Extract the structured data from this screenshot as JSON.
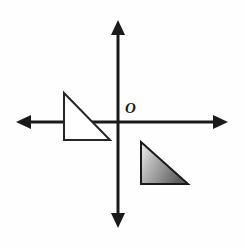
{
  "figure": {
    "background_color": "#fefefe",
    "width": 245,
    "height": 248
  },
  "axes": {
    "stroke_color": "#1a1a1a",
    "stroke_width": 3,
    "origin": {
      "x": 118,
      "y": 122
    },
    "x_axis": {
      "label": "x-axis",
      "x_start": 16,
      "x_end": 228,
      "y": 122,
      "arrow_left": true,
      "arrow_right": true
    },
    "y_axis": {
      "label": "y-axis",
      "y_start": 20,
      "y_end": 228,
      "x": 118,
      "arrow_up": true,
      "arrow_down": true
    },
    "origin_label": "O"
  },
  "shapes": {
    "preimage_triangle": {
      "name": "unfilled-triangle-quadrant-two",
      "fill": "#ffffff",
      "stroke_color": "#262626",
      "stroke_width": 2,
      "vertices": [
        {
          "x": 64,
          "y": 93
        },
        {
          "x": 64,
          "y": 140
        },
        {
          "x": 110,
          "y": 140
        }
      ],
      "right_angle_at": "bottom-left"
    },
    "image_triangle": {
      "name": "shaded-triangle-quadrant-four",
      "fill_gradient_from": "#f2f2f2",
      "fill_gradient_to": "#5e5e5e",
      "stroke_color": "#1a1a1a",
      "stroke_width": 2,
      "vertices": [
        {
          "x": 141,
          "y": 142
        },
        {
          "x": 141,
          "y": 184
        },
        {
          "x": 188,
          "y": 184
        }
      ],
      "right_angle_at": "bottom-left"
    }
  }
}
